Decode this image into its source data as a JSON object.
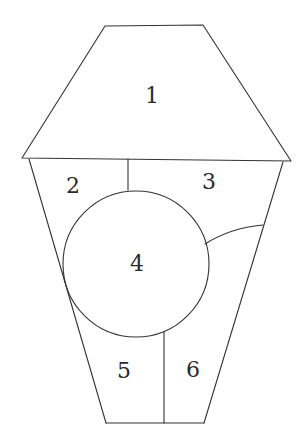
{
  "diagram": {
    "stroke_color": "#333333",
    "background": "#ffffff",
    "regions": [
      {
        "id": "1",
        "label": "1",
        "shape": "trapezoid-roof",
        "label_pos": [
          152,
          96
        ]
      },
      {
        "id": "2",
        "label": "2",
        "shape": "upper-left-panel",
        "label_pos": [
          73,
          186
        ]
      },
      {
        "id": "3",
        "label": "3",
        "shape": "upper-right-panel",
        "label_pos": [
          209,
          182
        ]
      },
      {
        "id": "4",
        "label": "4",
        "shape": "circle",
        "label_pos": [
          137,
          264
        ]
      },
      {
        "id": "5",
        "label": "5",
        "shape": "lower-left-panel",
        "label_pos": [
          124,
          371
        ]
      },
      {
        "id": "6",
        "label": "6",
        "shape": "lower-right-panel",
        "label_pos": [
          193,
          370
        ]
      }
    ]
  }
}
